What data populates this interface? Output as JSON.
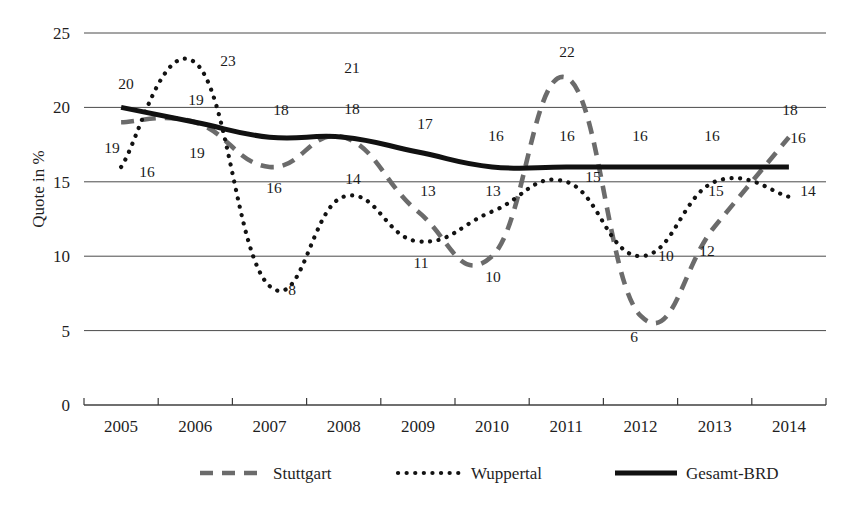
{
  "chart_data": {
    "type": "line",
    "title": "",
    "xlabel": "",
    "ylabel": "Quote in %",
    "categories": [
      "2005",
      "2006",
      "2007",
      "2008",
      "2009",
      "2010",
      "2011",
      "2012",
      "2013",
      "2014"
    ],
    "ylim": [
      0,
      25
    ],
    "yticks": [
      0,
      5,
      10,
      15,
      20,
      25
    ],
    "ytick_labels": [
      "0",
      "5",
      "10",
      "15",
      "20",
      "25"
    ],
    "grid": true,
    "legend_position": "bottom",
    "series": [
      {
        "name": "Stuttgart",
        "style": "dashed",
        "color": "#6b6b6b",
        "values": [
          19,
          19,
          16,
          18,
          13,
          10,
          22,
          6,
          12,
          18
        ],
        "labels": [
          "19",
          "19",
          "16",
          "18",
          "13",
          "10",
          "22",
          "6",
          "12",
          "18"
        ]
      },
      {
        "name": "Wuppertal",
        "style": "dotted",
        "color": "#121212",
        "values": [
          16,
          23,
          8,
          14,
          11,
          13,
          15,
          10,
          15,
          14
        ],
        "labels": [
          "16",
          "23",
          "8",
          "14",
          "11",
          "13",
          "15",
          "10",
          "15",
          "14"
        ]
      },
      {
        "name": "Gesamt-BRD",
        "style": "solid",
        "color": "#111111",
        "values": [
          20,
          19,
          18,
          18,
          17,
          16,
          16,
          16,
          16,
          16
        ],
        "labels": [
          "20",
          "19",
          "18",
          "18",
          "17",
          "16",
          "16",
          "16",
          "16",
          "16"
        ]
      }
    ],
    "annotations": [
      {
        "text": "20",
        "x": 126,
        "y": 89,
        "series": "Gesamt-BRD",
        "point": "2005"
      },
      {
        "text": "19",
        "x": 112,
        "y": 153,
        "series": "Stuttgart",
        "point": "2005"
      },
      {
        "text": "16",
        "x": 147,
        "y": 177,
        "series": "Wuppertal",
        "point": "2005"
      },
      {
        "text": "19",
        "x": 196,
        "y": 105,
        "series": "Stuttgart",
        "point": "2006"
      },
      {
        "text": "23",
        "x": 228,
        "y": 66,
        "series": "Wuppertal",
        "point": "2006"
      },
      {
        "text": "19",
        "x": 197,
        "y": 158,
        "series": "Gesamt-BRD",
        "point": "2006"
      },
      {
        "text": "16",
        "x": 274,
        "y": 193,
        "series": "Stuttgart",
        "point": "2007"
      },
      {
        "text": "18",
        "x": 281,
        "y": 115,
        "series": "Gesamt-BRD",
        "point": "2007"
      },
      {
        "text": "8",
        "x": 292,
        "y": 295,
        "series": "Wuppertal",
        "point": "2007"
      },
      {
        "text": "21",
        "x": 352,
        "y": 73,
        "series": "Stuttgart",
        "point": "peak"
      },
      {
        "text": "18",
        "x": 352,
        "y": 114,
        "series": "Gesamt-BRD",
        "point": "2008"
      },
      {
        "text": "14",
        "x": 353,
        "y": 184,
        "series": "Wuppertal",
        "point": "2008"
      },
      {
        "text": "17",
        "x": 425,
        "y": 129,
        "series": "Gesamt-BRD",
        "point": "2009"
      },
      {
        "text": "13",
        "x": 428,
        "y": 196,
        "series": "Stuttgart",
        "point": "2009"
      },
      {
        "text": "11",
        "x": 421,
        "y": 268,
        "series": "Wuppertal",
        "point": "2009"
      },
      {
        "text": "16",
        "x": 496,
        "y": 141,
        "series": "Gesamt-BRD",
        "point": "2010"
      },
      {
        "text": "13",
        "x": 493,
        "y": 196,
        "series": "Wuppertal",
        "point": "2010"
      },
      {
        "text": "10",
        "x": 493,
        "y": 282,
        "series": "Stuttgart",
        "point": "2010"
      },
      {
        "text": "22",
        "x": 567,
        "y": 57,
        "series": "Stuttgart",
        "point": "2011"
      },
      {
        "text": "16",
        "x": 567,
        "y": 141,
        "series": "Gesamt-BRD",
        "point": "2011"
      },
      {
        "text": "15",
        "x": 593,
        "y": 182,
        "series": "Wuppertal",
        "point": "2011"
      },
      {
        "text": "16",
        "x": 640,
        "y": 141,
        "series": "Gesamt-BRD",
        "point": "2012"
      },
      {
        "text": "10",
        "x": 666,
        "y": 261,
        "series": "Wuppertal",
        "point": "2012"
      },
      {
        "text": "6",
        "x": 634,
        "y": 342,
        "series": "Stuttgart",
        "point": "2012"
      },
      {
        "text": "16",
        "x": 712,
        "y": 141,
        "series": "Gesamt-BRD",
        "point": "2013"
      },
      {
        "text": "15",
        "x": 716,
        "y": 196,
        "series": "Wuppertal",
        "point": "2013"
      },
      {
        "text": "12",
        "x": 707,
        "y": 256,
        "series": "Stuttgart",
        "point": "2013"
      },
      {
        "text": "18",
        "x": 790,
        "y": 115,
        "series": "Stuttgart",
        "point": "2014"
      },
      {
        "text": "16",
        "x": 798,
        "y": 143,
        "series": "Gesamt-BRD",
        "point": "2014"
      },
      {
        "text": "14",
        "x": 808,
        "y": 196,
        "series": "Wuppertal",
        "point": "2014"
      }
    ]
  },
  "legend": {
    "items": [
      {
        "label": "Stuttgart",
        "style": "dashed"
      },
      {
        "label": "Wuppertal",
        "style": "dotted"
      },
      {
        "label": "Gesamt-BRD",
        "style": "solid"
      }
    ]
  },
  "axes": {
    "y_title": "Quote in %"
  }
}
